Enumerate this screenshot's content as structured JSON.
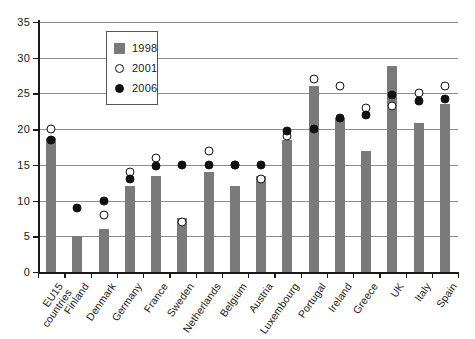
{
  "chart_data": {
    "type": "bar",
    "title": "",
    "subtitle": "",
    "xlabel": "",
    "ylabel": "",
    "ylim": [
      0,
      35
    ],
    "yticks": [
      0,
      5,
      10,
      15,
      20,
      25,
      30,
      35
    ],
    "grid": true,
    "legend_position": "top-left-inside",
    "categories": [
      "EU15 countries",
      "Finland",
      "Denmark",
      "Germany",
      "France",
      "Sweden",
      "Netherlands",
      "Belgium",
      "Austria",
      "Luxembourg",
      "Portugal",
      "Ireland",
      "Greece",
      "UK",
      "Italy",
      "Spain"
    ],
    "categories_lines": [
      [
        "EU15",
        "countries"
      ],
      [
        "Finland"
      ],
      [
        "Denmark"
      ],
      [
        "Germany"
      ],
      [
        "France"
      ],
      [
        "Sweden"
      ],
      [
        "Netherlands"
      ],
      [
        "Belgium"
      ],
      [
        "Austria"
      ],
      [
        "Luxembourg"
      ],
      [
        "Portugal"
      ],
      [
        "Ireland"
      ],
      [
        "Greece"
      ],
      [
        "UK"
      ],
      [
        "Italy"
      ],
      [
        "Spain"
      ]
    ],
    "series": [
      {
        "name": "1998",
        "marker": "bar",
        "color": "#7a7a7a",
        "values": [
          18.8,
          5.0,
          6.0,
          12.0,
          13.5,
          7.5,
          14.0,
          12.0,
          13.5,
          18.5,
          26.0,
          21.5,
          17.0,
          28.8,
          20.8,
          23.5
        ]
      },
      {
        "name": "2001",
        "marker": "open-circle",
        "color": "#ffffff",
        "values": [
          20.0,
          null,
          8.0,
          14.0,
          16.0,
          7.0,
          17.0,
          15.0,
          13.0,
          19.0,
          27.0,
          26.0,
          23.0,
          23.3,
          25.0,
          26.0
        ]
      },
      {
        "name": "2006",
        "marker": "filled-circle",
        "color": "#111111",
        "values": [
          18.5,
          9.0,
          10.0,
          13.0,
          14.8,
          15.0,
          15.0,
          15.0,
          15.0,
          19.8,
          20.0,
          21.5,
          22.0,
          24.8,
          24.0,
          24.2
        ]
      }
    ]
  },
  "legend": {
    "items": [
      {
        "label": "1998",
        "marker": "square"
      },
      {
        "label": "2001",
        "marker": "open-circle"
      },
      {
        "label": "2006",
        "marker": "filled-circle"
      }
    ]
  },
  "colors": {
    "bar": "#7a7a7a",
    "axis": "#1a1a1a",
    "grid": "#8d8d8d",
    "marker_fill": "#111111",
    "marker_open": "#ffffff"
  }
}
